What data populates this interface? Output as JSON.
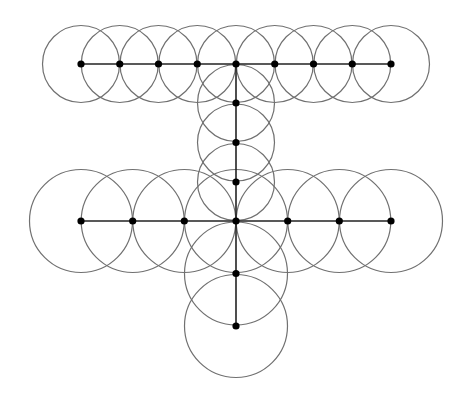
{
  "diagram": {
    "colors": {
      "background": "#ffffff",
      "circle_stroke": "#707070",
      "edge_stroke": "#222222",
      "node_fill": "#000000"
    },
    "groups": [
      {
        "name": "upper-row",
        "radius": 38.5,
        "nodes": [
          [
            81,
            64
          ],
          [
            119.75,
            64
          ],
          [
            158.5,
            64
          ],
          [
            197.25,
            64
          ],
          [
            236,
            64
          ],
          [
            274.75,
            64
          ],
          [
            313.5,
            64
          ],
          [
            352.25,
            64
          ],
          [
            391,
            64
          ]
        ]
      },
      {
        "name": "upper-stem",
        "radius": 38.5,
        "nodes": [
          [
            236,
            103
          ],
          [
            236,
            142.5
          ],
          [
            236,
            182
          ]
        ]
      },
      {
        "name": "lower-row",
        "radius": 51.5,
        "nodes": [
          [
            81,
            221
          ],
          [
            132.7,
            221
          ],
          [
            184.3,
            221
          ],
          [
            236,
            221
          ],
          [
            287.7,
            221
          ],
          [
            339.3,
            221
          ],
          [
            391,
            221
          ]
        ]
      },
      {
        "name": "lower-stem",
        "radius": 51.5,
        "nodes": [
          [
            236,
            273.5
          ],
          [
            236,
            326
          ]
        ]
      }
    ],
    "edges": [
      [
        [
          81,
          64
        ],
        [
          391,
          64
        ]
      ],
      [
        [
          236,
          64
        ],
        [
          236,
          221
        ]
      ],
      [
        [
          81,
          221
        ],
        [
          391,
          221
        ]
      ],
      [
        [
          236,
          221
        ],
        [
          236,
          326
        ]
      ]
    ],
    "node_radius": 3.6
  }
}
